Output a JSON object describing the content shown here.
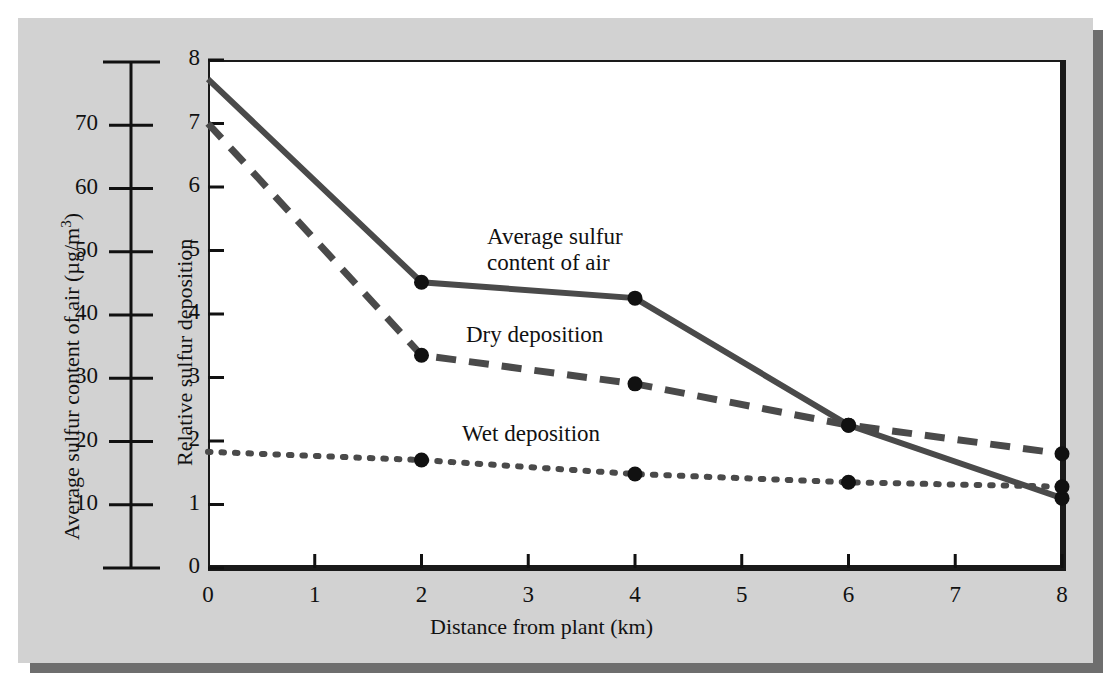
{
  "figure": {
    "panel_bg": "#d2d2d2",
    "plot_bg": "#ffffff",
    "frame_color": "#1a1a1a",
    "line_color": "#4a4a4a",
    "marker_color": "#111111"
  },
  "left_axis": {
    "title_main": "Average sulfur content of air (",
    "title_unit_mu": "μg/m",
    "title_unit_exp": "3",
    "title_close": ")",
    "title_full": "Average sulfur content of air (μg/m3)",
    "ticks": [
      "70",
      "60",
      "50",
      "40",
      "30",
      "20",
      "10"
    ],
    "tick_values": [
      70,
      60,
      50,
      40,
      30,
      20,
      10
    ],
    "range": [
      0,
      80
    ],
    "units": "µg/m³"
  },
  "right_axis": {
    "title": "Relative sulfur deposition",
    "ticks": [
      "8",
      "7",
      "6",
      "5",
      "4",
      "3",
      "2",
      "1",
      "0"
    ],
    "tick_values": [
      8,
      7,
      6,
      5,
      4,
      3,
      2,
      1,
      0
    ],
    "range": [
      0,
      8
    ]
  },
  "x_axis": {
    "title": "Distance from plant (km)",
    "ticks": [
      "0",
      "1",
      "2",
      "3",
      "4",
      "5",
      "6",
      "7",
      "8"
    ],
    "tick_values": [
      0,
      1,
      2,
      3,
      4,
      5,
      6,
      7,
      8
    ],
    "range": [
      0,
      8
    ]
  },
  "series_labels": {
    "average_sulfur": "Average sulfur\ncontent of air",
    "dry_deposition": "Dry deposition",
    "wet_deposition": "Wet deposition"
  },
  "chart_data": {
    "type": "line",
    "title": "",
    "xlabel": "Distance from plant (km)",
    "ylabel": "Relative sulfur deposition",
    "ylabel_secondary": "Average sulfur content of air (µg/m³)",
    "xlim": [
      0,
      8
    ],
    "ylim": [
      0,
      8
    ],
    "ylim_secondary": [
      0,
      80
    ],
    "grid": false,
    "legend": "inline-annotations",
    "x": [
      0,
      2,
      4,
      6,
      8
    ],
    "series": [
      {
        "name": "Average sulfur content of air",
        "style": "solid",
        "color": "#4a4a4a",
        "markers": true,
        "values": [
          7.7,
          4.5,
          4.25,
          2.25,
          1.1
        ]
      },
      {
        "name": "Dry deposition",
        "style": "dashed",
        "color": "#4a4a4a",
        "markers": true,
        "values": [
          7.0,
          3.35,
          2.9,
          2.25,
          1.8
        ]
      },
      {
        "name": "Wet deposition",
        "style": "dotted",
        "color": "#4a4a4a",
        "markers": true,
        "values": [
          1.83,
          1.7,
          1.48,
          1.35,
          1.28
        ]
      }
    ]
  }
}
